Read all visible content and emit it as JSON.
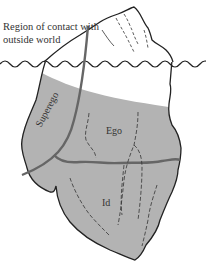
{
  "figure": {
    "labels": {
      "contact": "Region of contact with outside world",
      "superego": "Superego",
      "ego": "Ego",
      "id": "Id"
    },
    "colors": {
      "background": "#ffffff",
      "submerged_fill": "#b3b3b3",
      "outline": "#222222",
      "boundary_line": "#666666",
      "text": "#333333"
    }
  }
}
